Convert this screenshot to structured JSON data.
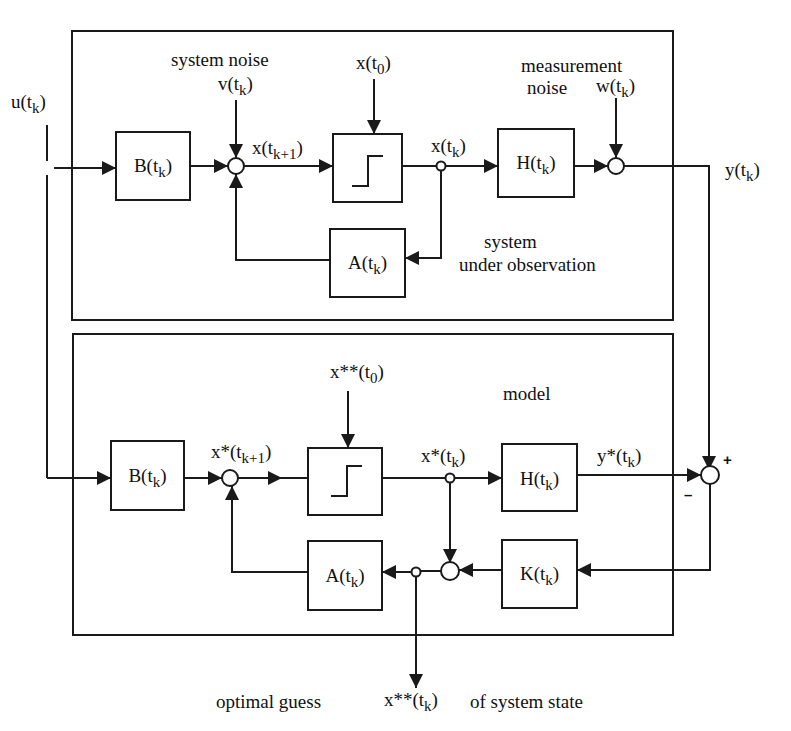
{
  "diagram": {
    "type": "block-diagram",
    "colors": {
      "line": "#1a1a1a",
      "background": "#ffffff"
    }
  },
  "labels": {
    "input": {
      "main": "u(t",
      "sub": "k",
      "close": ")"
    },
    "system_noise_caption": "system noise",
    "system_noise": {
      "main": "v(t",
      "sub": "k",
      "close": ")"
    },
    "initial_state": {
      "main": "x(t",
      "sub": "0",
      "close": ")"
    },
    "next_state": {
      "main": "x(t",
      "sub": "k+1",
      "close": ")"
    },
    "state": {
      "main": "x(t",
      "sub": "k",
      "close": ")"
    },
    "measurement_noise_caption_1": "measurement",
    "measurement_noise_caption_2": "noise",
    "measurement_noise": {
      "main": "w(t",
      "sub": "k",
      "close": ")"
    },
    "output": {
      "main": "y(t",
      "sub": "k",
      "close": ")"
    },
    "system_caption_1": "system",
    "system_caption_2": "under observation",
    "model_caption": "model",
    "model_initial_state": {
      "main": "x**(t",
      "sub": "0",
      "close": ")"
    },
    "model_next_state": {
      "main": "x*(t",
      "sub": "k+1",
      "close": ")"
    },
    "model_state": {
      "main": "x*(t",
      "sub": "k",
      "close": ")"
    },
    "model_output": {
      "main": "y*(t",
      "sub": "k",
      "close": ")"
    },
    "plus_sign": "+",
    "minus_sign": "–",
    "estimate_prefix": "optimal guess",
    "estimate": {
      "main": "x**(t",
      "sub": "k",
      "close": ")"
    },
    "estimate_suffix": "of system state"
  },
  "blocks": {
    "system": {
      "B": {
        "main": "B(t",
        "sub": "k",
        "close": ")"
      },
      "delay": {
        "icon": "step-icon"
      },
      "H": {
        "main": "H(t",
        "sub": "k",
        "close": ")"
      },
      "A": {
        "main": "A(t",
        "sub": "k",
        "close": ")"
      }
    },
    "model": {
      "B": {
        "main": "B(t",
        "sub": "k",
        "close": ")"
      },
      "delay": {
        "icon": "step-icon"
      },
      "H": {
        "main": "H(t",
        "sub": "k",
        "close": ")"
      },
      "K": {
        "main": "K(t",
        "sub": "k",
        "close": ")"
      },
      "A": {
        "main": "A(t",
        "sub": "k",
        "close": ")"
      }
    }
  }
}
